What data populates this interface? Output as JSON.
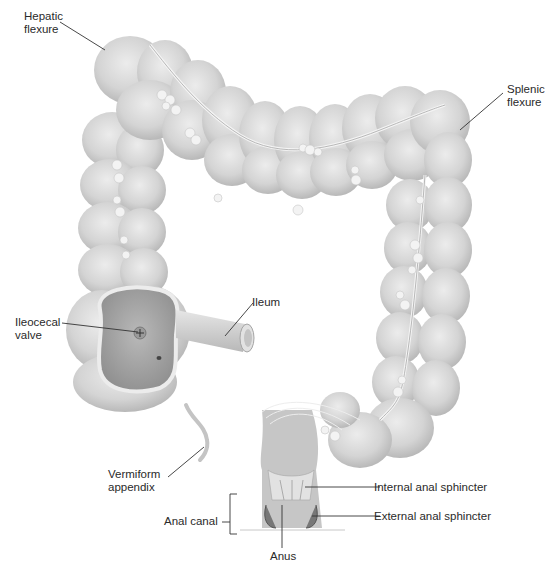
{
  "diagram": {
    "colors": {
      "tissue": "#d6d6d6",
      "tissue_shadow": "#b4b4b4",
      "tissue_highlight": "#eeeeee",
      "fat_deposits": "#f2f2f2",
      "interior": "#a9a9a9",
      "leader_line": "#333333",
      "text": "#2a2a2a"
    },
    "labels": {
      "hepatic_flexure": {
        "line1": "Hepatic",
        "line2": "flexure"
      },
      "splenic_flexure": {
        "line1": "Splenic",
        "line2": "flexure"
      },
      "ileocecal_valve": {
        "line1": "Ileocecal",
        "line2": "valve"
      },
      "ileum": {
        "line1": "Ileum"
      },
      "vermiform_appendix": {
        "line1": "Vermiform",
        "line2": "appendix"
      },
      "anal_canal": {
        "line1": "Anal canal"
      },
      "internal_anal_sphincter": {
        "line1": "Internal anal sphincter"
      },
      "external_anal_sphincter": {
        "line1": "External anal sphincter"
      },
      "anus": {
        "line1": "Anus"
      }
    }
  }
}
